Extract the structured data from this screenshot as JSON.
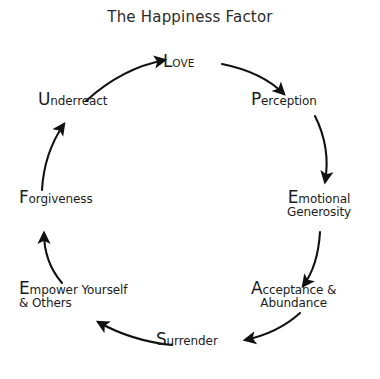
{
  "title": "The Happiness Factor",
  "colors": {
    "background": "#ffffff",
    "text": "#1c1c1c",
    "title": "#2b2b2b",
    "arrow": "#111111"
  },
  "diagram": {
    "type": "cycle",
    "direction": "clockwise",
    "node_count": 8,
    "nodes": [
      {
        "id": "love",
        "cap": "L",
        "rest": "OVE",
        "line2": "",
        "style": "smallcaps",
        "position": "top"
      },
      {
        "id": "perception",
        "cap": "P",
        "rest": "erception",
        "line2": "",
        "style": "normal",
        "position": "upper-right"
      },
      {
        "id": "emotional",
        "cap": "E",
        "rest": "motional",
        "line2": "Generosity",
        "style": "normal",
        "position": "right"
      },
      {
        "id": "acceptance",
        "cap": "A",
        "rest": "cceptance &",
        "line2": "Abundance",
        "style": "normal",
        "position": "lower-right"
      },
      {
        "id": "surrender",
        "cap": "S",
        "rest": "urrender",
        "line2": "",
        "style": "normal",
        "position": "bottom"
      },
      {
        "id": "empower",
        "cap": "E",
        "rest": "mpower Yourself",
        "line2": "& Others",
        "style": "normal",
        "position": "lower-left"
      },
      {
        "id": "forgiveness",
        "cap": "F",
        "rest": "orgiveness",
        "line2": "",
        "style": "normal",
        "position": "left"
      },
      {
        "id": "underreact",
        "cap": "U",
        "rest": "nderreact",
        "line2": "",
        "style": "normal",
        "position": "upper-left"
      }
    ],
    "edges": [
      {
        "from": "love",
        "to": "perception"
      },
      {
        "from": "perception",
        "to": "emotional"
      },
      {
        "from": "emotional",
        "to": "acceptance"
      },
      {
        "from": "acceptance",
        "to": "surrender"
      },
      {
        "from": "surrender",
        "to": "empower"
      },
      {
        "from": "empower",
        "to": "forgiveness"
      },
      {
        "from": "forgiveness",
        "to": "underreact"
      },
      {
        "from": "underreact",
        "to": "love"
      }
    ]
  }
}
